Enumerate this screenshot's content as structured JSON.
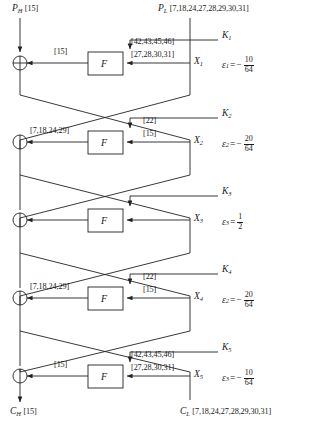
{
  "figure": {
    "type": "feistel-cipher-linear-cryptanalysis-diagram",
    "rounds_count": 5,
    "function_box_label": "F",
    "xor_symbol": "⊕"
  },
  "inputs": {
    "left_label": "P",
    "left_sub": "H",
    "left_mask": "[15]",
    "right_label": "P",
    "right_sub": "L",
    "right_mask": "[7,18,24,27,28,29,30,31]"
  },
  "outputs": {
    "left_label": "C",
    "left_sub": "H",
    "left_mask": "[15]",
    "right_label": "C",
    "right_sub": "L",
    "right_mask": "[7,18,24,27,28,29,30,31]"
  },
  "rounds": [
    {
      "index": 1,
      "key_label": "K",
      "key_sub": "1",
      "x_label": "X",
      "x_sub": "1",
      "output_mask": "[15]",
      "input_mask_top": "[42,43,45,46]",
      "input_mask_bottom": "[27,28,30,31]",
      "eps_label": "ε",
      "eps_sub": "1",
      "eps_sign": "−",
      "eps_num": "10",
      "eps_den": "64",
      "eps_plain": false
    },
    {
      "index": 2,
      "key_label": "K",
      "key_sub": "2",
      "x_label": "X",
      "x_sub": "2",
      "output_mask": "[7,18,24,29]",
      "input_mask_top": "[22]",
      "input_mask_bottom": "[15]",
      "eps_label": "ε",
      "eps_sub": "2",
      "eps_sign": "−",
      "eps_num": "20",
      "eps_den": "64",
      "eps_plain": false
    },
    {
      "index": 3,
      "key_label": "K",
      "key_sub": "3",
      "x_label": "X",
      "x_sub": "3",
      "output_mask": "",
      "input_mask_top": "",
      "input_mask_bottom": "",
      "eps_label": "ε",
      "eps_sub": "3",
      "eps_sign": "",
      "eps_num": "1",
      "eps_den": "2",
      "eps_plain": true
    },
    {
      "index": 4,
      "key_label": "K",
      "key_sub": "4",
      "x_label": "X",
      "x_sub": "4",
      "output_mask": "[7,18,24,29]",
      "input_mask_top": "[22]",
      "input_mask_bottom": "[15]",
      "eps_label": "ε",
      "eps_sub": "2",
      "eps_sign": "−",
      "eps_num": "20",
      "eps_den": "64",
      "eps_plain": false
    },
    {
      "index": 5,
      "key_label": "K",
      "key_sub": "5",
      "x_label": "X",
      "x_sub": "5",
      "output_mask": "[15]",
      "input_mask_top": "[42,43,45,46]",
      "input_mask_bottom": "[27,28,30,31]",
      "eps_label": "ε",
      "eps_sub": "3",
      "eps_sign": "−",
      "eps_num": "10",
      "eps_den": "64",
      "eps_plain": false
    }
  ],
  "colors": {
    "line": "#222222",
    "text": "#1a1a1a",
    "background": "#ffffff"
  }
}
